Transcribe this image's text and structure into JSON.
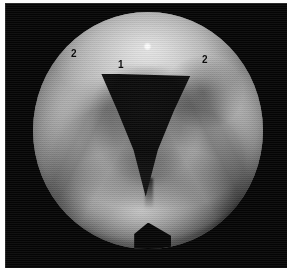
{
  "figure": {
    "kind": "endoscopic-photograph",
    "modality": "laryngoscopy",
    "width_px": 289,
    "height_px": 270,
    "colors": {
      "plate_background": "#050505",
      "page_background": "#fdfdfd",
      "tissue_light": "#d8d8d8",
      "tissue_mid": "#9b9b9b",
      "tissue_dark": "#3a3a3a",
      "aperture_dark": "#0a0a0a",
      "label_text": "#0a0a0a",
      "specular_white": "#ffffff"
    }
  },
  "annotations": {
    "items": [
      {
        "id": "label-1",
        "text": "1",
        "role": "glottic-aperture-callout",
        "x_px": 118,
        "y_px": 60
      },
      {
        "id": "label-2a",
        "text": "2",
        "role": "left-mucosal-fold-callout",
        "x_px": 71,
        "y_px": 49
      },
      {
        "id": "label-2b",
        "text": "2",
        "role": "right-mucosal-fold-callout",
        "x_px": 202,
        "y_px": 55
      }
    ]
  },
  "field_of_view": {
    "shape": "circle",
    "center_x_px": 143,
    "center_y_px": 127,
    "diameter_px": 230,
    "bottom_notch": "dark-wedge"
  },
  "features": {
    "specular_highlight": "light-reflection-spot",
    "aperture": "dark-triangular-opening",
    "texture": "halftone-print-dither"
  }
}
